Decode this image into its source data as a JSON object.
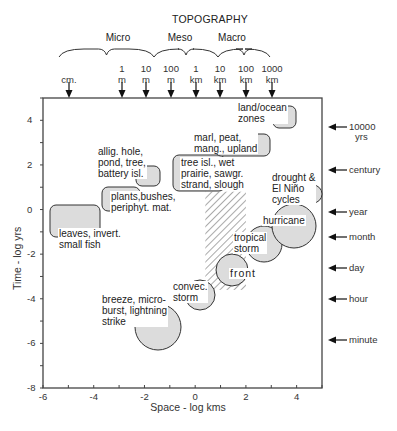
{
  "chart_data": {
    "type": "scatter",
    "title": "TOPOGRAPHY",
    "xlabel": "Space - log kms",
    "ylabel": "Time - log yrs",
    "xlim": [
      -6,
      5
    ],
    "ylim": [
      -8,
      5
    ],
    "x_ticks": [
      -6,
      -4,
      -2,
      0,
      2,
      4
    ],
    "y_ticks": [
      4,
      2,
      0,
      -2,
      -4,
      -6,
      -8
    ],
    "grid": false,
    "topography_ranges": [
      {
        "label": "Micro",
        "from_scale": "cm.",
        "to_scale": "10 m"
      },
      {
        "label": "Meso",
        "from_scale": "10 m",
        "to_scale": "10 km"
      },
      {
        "label": "Macro",
        "from_scale": "10 km",
        "to_scale": "1000 km"
      }
    ],
    "top_scale_markers": [
      {
        "line1": "",
        "line2": "cm.",
        "x": -5
      },
      {
        "line1": "1",
        "line2": "m",
        "x": -3
      },
      {
        "line1": "10",
        "line2": "m",
        "x": -2
      },
      {
        "line1": "100",
        "line2": "m",
        "x": -1
      },
      {
        "line1": "1",
        "line2": "km",
        "x": 0
      },
      {
        "line1": "10",
        "line2": "km",
        "x": 1
      },
      {
        "line1": "100",
        "line2": "km",
        "x": 2
      },
      {
        "line1": "1000",
        "line2": "km",
        "x": 3
      }
    ],
    "right_time_markers": [
      {
        "label": "10000 yrs",
        "y": 4
      },
      {
        "label": "century",
        "y": 2
      },
      {
        "label": "year",
        "y": 0
      },
      {
        "label": "month",
        "y": -1.1
      },
      {
        "label": "day",
        "y": -2.6
      },
      {
        "label": "hour",
        "y": -4
      },
      {
        "label": "minute",
        "y": -5.8
      }
    ],
    "topography_boxes": [
      {
        "label": "leaves, invert.\nsmall fish",
        "x0": -5.8,
        "x1": -3.8,
        "y0": -1.3,
        "y1": 0.3
      },
      {
        "label": "plants,bushes,\nperiphyt. mat.",
        "x0": -3.6,
        "x1": -2.5,
        "y0": -0.2,
        "y1": 0.9
      },
      {
        "label": "allig. hole,\npond, tree,\nbattery isl.",
        "x0": -2.5,
        "x1": -1.6,
        "y0": 1.3,
        "y1": 2.2
      },
      {
        "label": "tree isl., wet\nprairie, sawgr.\nstrand, slough",
        "x0": -0.9,
        "x1": 0.8,
        "y0": 1.5,
        "y1": 2.6
      },
      {
        "label": "marl, peat,\nmang., upland",
        "x0": 0.9,
        "x1": 2.3,
        "y0": 2.4,
        "y1": 3.2
      },
      {
        "label": "land/ocean\nzones",
        "x0": 2.6,
        "x1": 3.2,
        "y0": 3.5,
        "y1": 4.6
      }
    ],
    "weather_circles": [
      {
        "label": "breeze, micro-\nburst, lightning\nstrike",
        "x": -1.2,
        "y": -5.3,
        "r": 0.95
      },
      {
        "label": "convec.\nstorm",
        "x": 0.4,
        "y": -3.8,
        "r": 0.55
      },
      {
        "label": "front",
        "x": 1.1,
        "y": -2.7,
        "r": 0.6
      },
      {
        "label": "tropical\nstorm",
        "x": 2.2,
        "y": -1.5,
        "r": 0.75
      },
      {
        "label": "hurricane",
        "x": 3.8,
        "y": -0.85,
        "r": 0.9
      },
      {
        "label": "drought &\nEl Niño\ncycles",
        "x": 4.65,
        "y": 0.85,
        "r": 0.45
      }
    ],
    "hatched_region": {
      "x0": 0.4,
      "x1": 2.0,
      "y0": -3.6,
      "y1": 0.8
    }
  },
  "labels": {
    "title": "TOPOGRAPHY",
    "micro": "Micro",
    "meso": "Meso",
    "macro": "Macro",
    "xlabel": "Space - log kms",
    "ylabel": "Time - log yrs"
  }
}
